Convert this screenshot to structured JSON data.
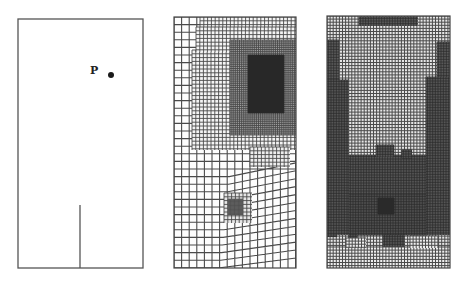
{
  "figure": {
    "background": "#ffffff",
    "line_color": "#4a4a4a",
    "panels": [
      {
        "id": "geometry",
        "box": {
          "x": 18,
          "y": 19,
          "w": 125,
          "h": 249
        },
        "point": {
          "label": "P",
          "label_x": 90,
          "label_y": 65,
          "dot_x": 111,
          "dot_y": 75
        },
        "crack": {
          "x": 80,
          "y_top": 205,
          "y_bottom": 268
        }
      },
      {
        "id": "mesh-adapted-1",
        "box": {
          "x": 174,
          "y": 17,
          "w": 122,
          "h": 251
        },
        "base_cell": 7.6,
        "refinements": [
          {
            "x": 200,
            "y": 17,
            "w": 96,
            "h": 10,
            "cell": 3.8,
            "shade": 0.05
          },
          {
            "x": 192,
            "y": 50,
            "w": 104,
            "h": 100,
            "cell": 3.8,
            "shade": 0.05
          },
          {
            "x": 196,
            "y": 27,
            "w": 100,
            "h": 25,
            "cell": 3.8,
            "shade": 0.05
          },
          {
            "x": 230,
            "y": 40,
            "w": 66,
            "h": 95,
            "cell": 1.9,
            "shade": 0.35
          },
          {
            "x": 248,
            "y": 55,
            "w": 36,
            "h": 58,
            "cell": 1.0,
            "shade": 0.85
          },
          {
            "x": 250,
            "y": 147,
            "w": 40,
            "h": 20,
            "cell": 3.8,
            "shade": 0.08
          },
          {
            "x": 224,
            "y": 193,
            "w": 28,
            "h": 30,
            "cell": 3.8,
            "shade": 0.12
          },
          {
            "x": 228,
            "y": 199,
            "w": 15,
            "h": 16,
            "cell": 1.3,
            "shade": 0.55
          }
        ],
        "distortion": {
          "from_x": 230,
          "from_y": 170,
          "note": "skewed coarse cells lower right"
        }
      },
      {
        "id": "mesh-adapted-2",
        "box": {
          "x": 327,
          "y": 16,
          "w": 123,
          "h": 252
        },
        "base_cell": 3.1,
        "base_shade": 0.12,
        "refinements": [
          {
            "x": 359,
            "y": 17,
            "w": 59,
            "h": 9,
            "cell": 1.6,
            "shade": 0.5
          },
          {
            "x": 327,
            "y": 40,
            "w": 12,
            "h": 40,
            "cell": 1.6,
            "shade": 0.5
          },
          {
            "x": 327,
            "y": 80,
            "w": 22,
            "h": 155,
            "cell": 1.6,
            "shade": 0.55
          },
          {
            "x": 437,
            "y": 42,
            "w": 13,
            "h": 35,
            "cell": 1.6,
            "shade": 0.5
          },
          {
            "x": 426,
            "y": 77,
            "w": 24,
            "h": 158,
            "cell": 1.6,
            "shade": 0.55
          },
          {
            "x": 349,
            "y": 155,
            "w": 77,
            "h": 40,
            "cell": 1.6,
            "shade": 0.55
          },
          {
            "x": 349,
            "y": 195,
            "w": 77,
            "h": 40,
            "cell": 1.6,
            "shade": 0.6
          },
          {
            "x": 376,
            "y": 145,
            "w": 18,
            "h": 12,
            "cell": 1.6,
            "shade": 0.55
          },
          {
            "x": 402,
            "y": 150,
            "w": 10,
            "h": 8,
            "cell": 1.6,
            "shade": 0.55
          },
          {
            "x": 378,
            "y": 198,
            "w": 16,
            "h": 16,
            "cell": 1.0,
            "shade": 0.9
          },
          {
            "x": 383,
            "y": 235,
            "w": 22,
            "h": 12,
            "cell": 1.6,
            "shade": 0.55
          },
          {
            "x": 349,
            "y": 235,
            "w": 8,
            "h": 4,
            "cell": 1.6,
            "shade": 0.55
          },
          {
            "x": 327,
            "y": 235,
            "w": 10,
            "h": 2,
            "cell": 1.6,
            "shade": 0.55
          }
        ],
        "light_bottom": [
          {
            "x": 327,
            "y": 247,
            "w": 123,
            "h": 21
          },
          {
            "x": 346,
            "y": 238,
            "w": 20,
            "h": 10
          },
          {
            "x": 410,
            "y": 236,
            "w": 28,
            "h": 12
          }
        ]
      }
    ]
  }
}
